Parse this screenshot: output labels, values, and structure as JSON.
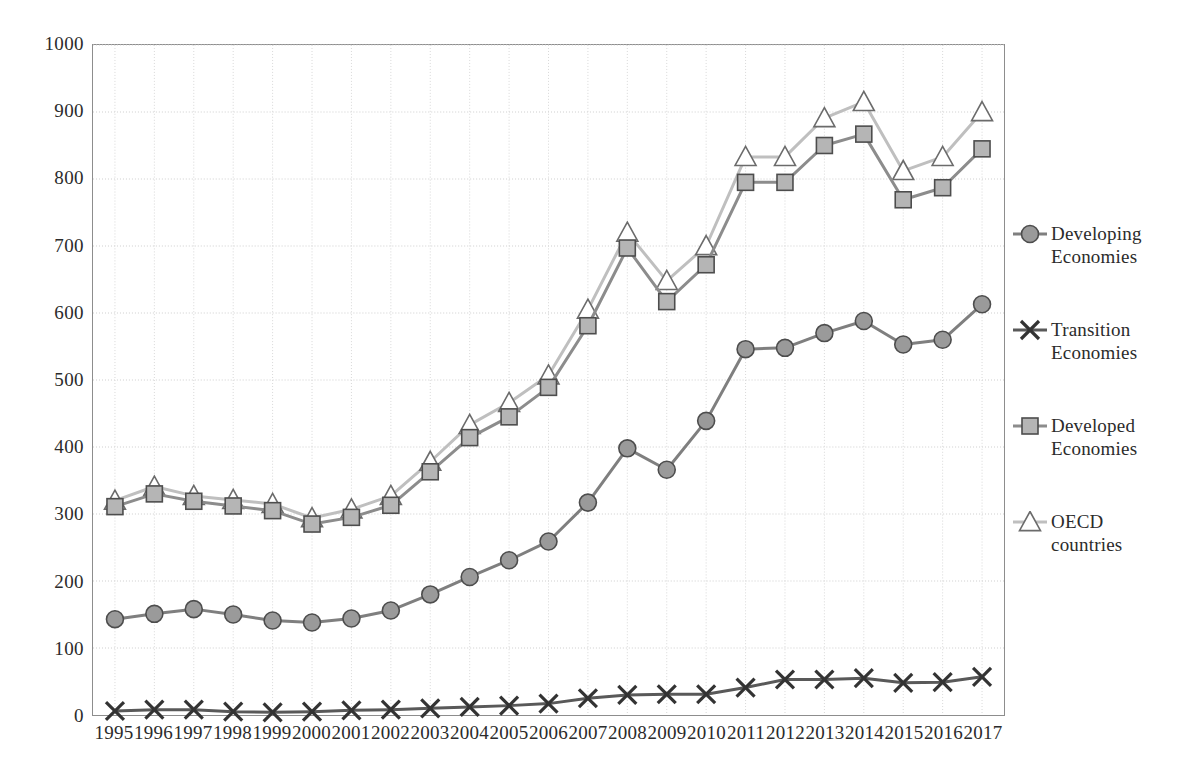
{
  "chart_data": {
    "type": "line",
    "title": "",
    "xlabel": "",
    "ylabel": "",
    "ylim": [
      0,
      1000
    ],
    "ytick_step": 100,
    "yticks": [
      0,
      100,
      200,
      300,
      400,
      500,
      600,
      700,
      800,
      900,
      1000
    ],
    "grid": true,
    "legend_position": "right",
    "categories": [
      "1995",
      "1996",
      "1997",
      "1998",
      "1999",
      "2000",
      "2001",
      "2002",
      "2003",
      "2004",
      "2005",
      "2006",
      "2007",
      "2008",
      "2009",
      "2010",
      "2011",
      "2012",
      "2013",
      "2014",
      "2015",
      "2016",
      "2017"
    ],
    "series": [
      {
        "name": "Developing Economies",
        "marker": "circle",
        "color": "#7f7f7f",
        "values": [
          143,
          151,
          158,
          150,
          141,
          138,
          144,
          156,
          180,
          206,
          231,
          259,
          317,
          398,
          366,
          439,
          546,
          548,
          570,
          588,
          553,
          560,
          613
        ]
      },
      {
        "name": "Transition Economies",
        "marker": "x",
        "color": "#595959",
        "values": [
          6,
          8,
          8,
          5,
          4,
          5,
          7,
          8,
          10,
          12,
          14,
          17,
          25,
          30,
          31,
          31,
          41,
          53,
          53,
          55,
          48,
          49,
          57
        ]
      },
      {
        "name": "Developed Economies",
        "marker": "square",
        "color": "#8c8c8c",
        "values": [
          311,
          330,
          319,
          312,
          305,
          285,
          295,
          313,
          363,
          414,
          445,
          489,
          581,
          697,
          617,
          672,
          795,
          795,
          850,
          867,
          769,
          787,
          845
        ]
      },
      {
        "name": "OECD countries",
        "marker": "triangle",
        "color": "#bfbfbf",
        "values": [
          320,
          341,
          327,
          321,
          315,
          294,
          307,
          327,
          378,
          433,
          466,
          507,
          605,
          720,
          648,
          700,
          833,
          833,
          891,
          915,
          812,
          833,
          900
        ]
      }
    ]
  },
  "legend": {
    "items": [
      {
        "label": "Developing\nEconomies",
        "icon": "circle-marker-icon"
      },
      {
        "label": "Transition\nEconomies",
        "icon": "x-marker-icon"
      },
      {
        "label": "Developed\nEconomies",
        "icon": "square-marker-icon"
      },
      {
        "label": "OECD\ncountries",
        "icon": "triangle-marker-icon"
      }
    ]
  }
}
